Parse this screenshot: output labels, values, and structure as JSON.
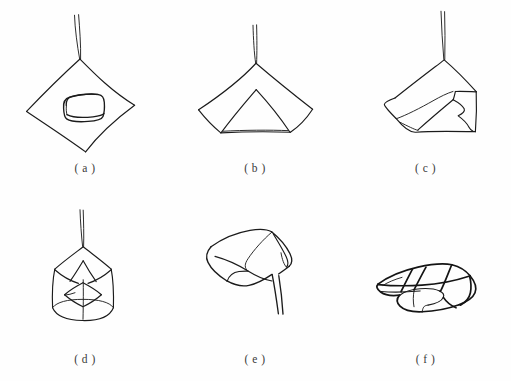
{
  "figure": {
    "title": "",
    "background_color": "#fefefe",
    "ink_color": "#1b1b1b",
    "columns": 3,
    "rows": 2,
    "panels": [
      {
        "id": "a",
        "caption": "( a )",
        "subject": "square wrapping cloth laid flat as a diamond with a rounded box placed in the center, cord rising from the top corner"
      },
      {
        "id": "b",
        "caption": "( b )",
        "subject": "cloth gathered to a peak forming a tent shape with an inner triangular fold and a wide flat base"
      },
      {
        "id": "c",
        "caption": "( c )",
        "subject": "cloth bundle pulled to one side with a folded flap on the right and cord rising from the apex"
      },
      {
        "id": "d",
        "caption": "( d )",
        "subject": "cylindrical bundle with gathered top, inner star fold and elliptical base"
      },
      {
        "id": "e",
        "caption": "( e )",
        "subject": "soft folded bundle with a trailing cord descending to the lower right"
      },
      {
        "id": "f",
        "caption": "( f )",
        "subject": "finished rectangular package tied with crossing straps, drawn in perspective"
      }
    ]
  }
}
